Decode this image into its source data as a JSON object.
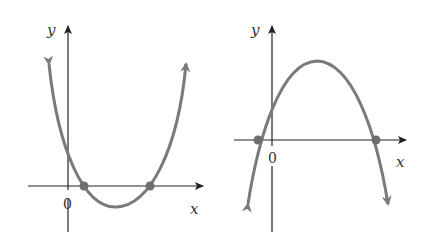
{
  "graphs": [
    {
      "name": "upward-parabola",
      "x_axis_label": "x",
      "y_axis_label": "y",
      "origin_label": "0",
      "opens": "up",
      "zeros": 2,
      "curve_color": "#7a7a7a"
    },
    {
      "name": "downward-parabola",
      "x_axis_label": "x",
      "y_axis_label": "y",
      "origin_label": "0",
      "opens": "down",
      "zeros": 2,
      "curve_color": "#7a7a7a"
    }
  ]
}
